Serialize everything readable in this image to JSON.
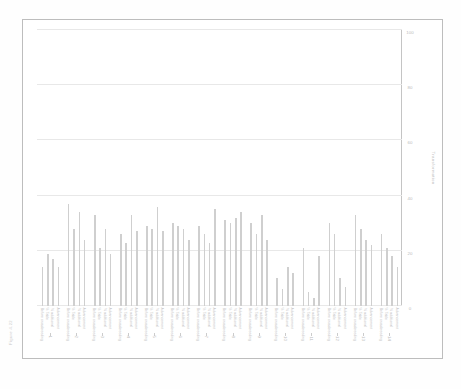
{
  "header": {
    "text": "Figure 4.22"
  },
  "chart_data": {
    "type": "bar",
    "orientation": "horizontal",
    "title": "",
    "xlabel": "Transformation",
    "ylabel": "",
    "xlim": [
      0,
      100
    ],
    "xticks": [
      0,
      20,
      40,
      60,
      80,
      100
    ],
    "xtick_labels": [
      "0",
      "20",
      "40",
      "60",
      "80",
      "100"
    ],
    "grid": true,
    "grid_axis": "x",
    "legend": "none",
    "bar_color": "#cfcfcf",
    "group_labels": [
      "1",
      "2",
      "3",
      "4",
      "5",
      "6",
      "7",
      "8",
      "9",
      "10",
      "11",
      "12",
      "13",
      "14"
    ],
    "categories": [
      "Before crossbreeding",
      "% Table",
      "% additional",
      "Advancement"
    ],
    "groups": [
      {
        "label": "1",
        "values": [
          14,
          19,
          17,
          14
        ]
      },
      {
        "label": "2",
        "values": [
          37,
          28,
          34,
          24
        ]
      },
      {
        "label": "3",
        "values": [
          33,
          21,
          28,
          19
        ]
      },
      {
        "label": "4",
        "values": [
          26,
          23,
          33,
          27
        ]
      },
      {
        "label": "5",
        "values": [
          29,
          28,
          36,
          27
        ]
      },
      {
        "label": "6",
        "values": [
          30,
          29,
          28,
          24
        ]
      },
      {
        "label": "7",
        "values": [
          29,
          26,
          23,
          35
        ]
      },
      {
        "label": "8",
        "values": [
          31,
          30,
          32,
          34
        ]
      },
      {
        "label": "9",
        "values": [
          30,
          26,
          33,
          24
        ]
      },
      {
        "label": "10",
        "values": [
          10,
          6,
          14,
          12
        ]
      },
      {
        "label": "11",
        "values": [
          21,
          5,
          3,
          18
        ]
      },
      {
        "label": "12",
        "values": [
          30,
          26,
          10,
          7
        ]
      },
      {
        "label": "13",
        "values": [
          33,
          28,
          24,
          22
        ]
      },
      {
        "label": "14",
        "values": [
          26,
          21,
          18,
          14
        ]
      }
    ]
  }
}
